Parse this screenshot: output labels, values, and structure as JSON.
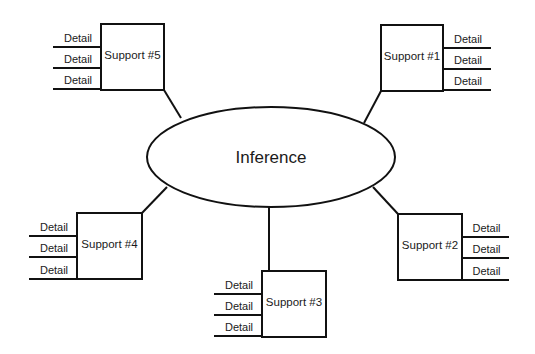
{
  "diagram": {
    "center": {
      "label": "Inference",
      "cx": 271,
      "cy": 157,
      "rx": 124,
      "ry": 50
    },
    "supports": [
      {
        "label": "Support #1",
        "box": {
          "x": 381,
          "y": 25,
          "w": 62,
          "h": 66
        },
        "details_side": "right",
        "details": [
          "Detail",
          "Detail",
          "Detail"
        ],
        "detail_lines_y": [
          48,
          69,
          90
        ],
        "detail_line_x": [
          443,
          491
        ],
        "connector": [
          381,
          91,
          364,
          123
        ]
      },
      {
        "label": "Support #2",
        "box": {
          "x": 398,
          "y": 214,
          "w": 64,
          "h": 66
        },
        "details_side": "right",
        "details": [
          "Detail",
          "Detail",
          "Detail"
        ],
        "detail_lines_y": [
          237,
          258,
          280
        ],
        "detail_line_x": [
          462,
          509
        ],
        "connector": [
          398,
          214,
          373,
          187
        ]
      },
      {
        "label": "Support #3",
        "box": {
          "x": 262,
          "y": 271,
          "w": 64,
          "h": 66
        },
        "details_side": "left",
        "details": [
          "Detail",
          "Detail",
          "Detail"
        ],
        "detail_lines_y": [
          294,
          315,
          336
        ],
        "detail_line_x": [
          214,
          262
        ],
        "connector": [
          269,
          207,
          269,
          271
        ]
      },
      {
        "label": "Support #4",
        "box": {
          "x": 77,
          "y": 213,
          "w": 65,
          "h": 66
        },
        "details_side": "left",
        "details": [
          "Detail",
          "Detail",
          "Detail"
        ],
        "detail_lines_y": [
          236,
          257,
          279
        ],
        "detail_line_x": [
          29,
          77
        ],
        "connector": [
          142,
          213,
          167,
          187
        ]
      },
      {
        "label": "Support #5",
        "box": {
          "x": 101,
          "y": 24,
          "w": 63,
          "h": 66
        },
        "details_side": "left",
        "details": [
          "Detail",
          "Detail",
          "Detail"
        ],
        "detail_lines_y": [
          47,
          68,
          89
        ],
        "detail_line_x": [
          53,
          101
        ],
        "connector": [
          164,
          90,
          181,
          118
        ]
      }
    ]
  }
}
